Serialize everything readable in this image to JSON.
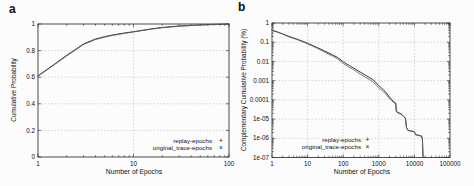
{
  "colors": {
    "background": "#fcfcfc",
    "frame": "#222222",
    "grid": "#b8b8b8",
    "text": "#111111",
    "series1_line": "#2f2f2f",
    "series2_line": "#5d5d5d"
  },
  "chart_data": [
    {
      "type": "line",
      "panel_label": "a",
      "xlabel": "Number of Epochs",
      "ylabel": "Cumulative Probability",
      "x_scale": "log",
      "x_range": [
        1,
        100
      ],
      "y_scale": "linear",
      "y_range": [
        0,
        1
      ],
      "x_ticks": [
        {
          "v": 1,
          "label": "1"
        },
        {
          "v": 10,
          "label": "10"
        },
        {
          "v": 100,
          "label": "100"
        }
      ],
      "y_ticks": [
        {
          "v": 0,
          "label": "0"
        },
        {
          "v": 0.2,
          "label": "0.2"
        },
        {
          "v": 0.4,
          "label": "0.4"
        },
        {
          "v": 0.6,
          "label": "0.6"
        },
        {
          "v": 0.8,
          "label": "0.8"
        },
        {
          "v": 1,
          "label": "1"
        }
      ],
      "grid": true,
      "legend_position": "bottom-right-inside",
      "series": [
        {
          "name": "replay-epochs",
          "marker": "+",
          "x": [
            1,
            1.5,
            2,
            3,
            4,
            5,
            6,
            8,
            10,
            15,
            20,
            30,
            50,
            70,
            100
          ],
          "y": [
            0.61,
            0.7,
            0.765,
            0.85,
            0.887,
            0.905,
            0.917,
            0.932,
            0.942,
            0.962,
            0.974,
            0.985,
            0.993,
            0.997,
            0.999
          ]
        },
        {
          "name": "original_trace-epochs",
          "marker": "×",
          "x": [
            1,
            1.5,
            2,
            3,
            4,
            5,
            6,
            8,
            10,
            15,
            20,
            30,
            50,
            70,
            100
          ],
          "y": [
            0.608,
            0.696,
            0.76,
            0.846,
            0.883,
            0.901,
            0.914,
            0.929,
            0.94,
            0.96,
            0.972,
            0.983,
            0.992,
            0.996,
            0.999
          ]
        }
      ]
    },
    {
      "type": "line",
      "panel_label": "b",
      "xlabel": "Number of Epochs",
      "ylabel": "Complementary Cumulative Probability (%)",
      "x_scale": "log",
      "x_range": [
        1,
        100000
      ],
      "y_scale": "log",
      "y_range": [
        1e-07,
        1
      ],
      "x_ticks": [
        {
          "v": 1,
          "label": "1"
        },
        {
          "v": 10,
          "label": "10"
        },
        {
          "v": 100,
          "label": "100"
        },
        {
          "v": 1000,
          "label": "1000"
        },
        {
          "v": 10000,
          "label": "10000"
        },
        {
          "v": 100000,
          "label": "100000"
        }
      ],
      "y_ticks": [
        {
          "v": 1,
          "label": "1"
        },
        {
          "v": 0.1,
          "label": "0.1"
        },
        {
          "v": 0.01,
          "label": "0.01"
        },
        {
          "v": 0.001,
          "label": "0.001"
        },
        {
          "v": 0.0001,
          "label": "0.0001"
        },
        {
          "v": 1e-05,
          "label": "1e-05"
        },
        {
          "v": 1e-06,
          "label": "1e-06"
        },
        {
          "v": 1e-07,
          "label": "1e-07"
        }
      ],
      "grid": true,
      "legend_position": "bottom-center-inside",
      "series": [
        {
          "name": "replay-epochs",
          "marker": "+",
          "x": [
            1,
            1.5,
            2,
            3,
            5,
            7,
            10,
            15,
            20,
            30,
            50,
            70,
            100,
            150,
            200,
            300,
            500,
            700,
            1000,
            1500,
            2000,
            2300,
            2600,
            3000,
            3100,
            3500,
            4200,
            5000,
            5600,
            6000,
            6500,
            8000,
            10000,
            10800,
            13000,
            16000,
            16800,
            17200,
            17500
          ],
          "y": [
            0.42,
            0.33,
            0.27,
            0.2,
            0.145,
            0.115,
            0.088,
            0.063,
            0.05,
            0.035,
            0.022,
            0.016,
            0.0095,
            0.006,
            0.0044,
            0.0028,
            0.0016,
            0.0011,
            0.00055,
            0.00028,
            0.00014,
            0.000105,
            8e-05,
            6.8e-05,
            2.6e-05,
            2.2e-05,
            1.9e-05,
            1.4e-05,
            1.1e-05,
            3.6e-06,
            2.7e-06,
            2.4e-06,
            2.2e-06,
            1.55e-06,
            1.45e-06,
            1.3e-06,
            9e-07,
            3e-07,
            1.05e-07
          ]
        },
        {
          "name": "original_trace-epochs",
          "marker": "×",
          "x": [
            1,
            1.5,
            2,
            3,
            5,
            7,
            10,
            15,
            20,
            30,
            50,
            70,
            100,
            150,
            200,
            300,
            500,
            700,
            1000,
            1500,
            2000,
            2300,
            2600,
            3000,
            3100,
            3500,
            4200,
            5000,
            5600,
            6000,
            6500,
            8000,
            10000,
            10800,
            13000,
            16000,
            16800,
            17200,
            17500
          ],
          "y": [
            0.42,
            0.325,
            0.262,
            0.192,
            0.138,
            0.108,
            0.082,
            0.058,
            0.045,
            0.031,
            0.019,
            0.0135,
            0.0078,
            0.0049,
            0.0036,
            0.0022,
            0.00125,
            0.00085,
            0.00042,
            0.00022,
            0.000115,
            9e-05,
            7.2e-05,
            6.2e-05,
            2.4e-05,
            2.05e-05,
            1.8e-05,
            1.35e-05,
            1.05e-05,
            3.4e-06,
            2.6e-06,
            2.35e-06,
            2.15e-06,
            1.5e-06,
            1.4e-06,
            1.25e-06,
            8.5e-07,
            2.8e-07,
            1e-07
          ]
        }
      ]
    }
  ]
}
